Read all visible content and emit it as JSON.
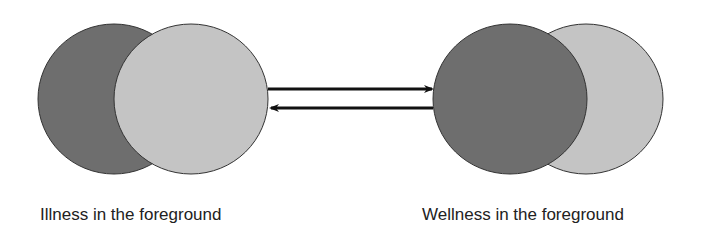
{
  "diagram": {
    "left_state": {
      "label": "Illness in the foreground",
      "front_circle": "illness",
      "back_circle": "wellness"
    },
    "right_state": {
      "label": "Wellness in the foreground",
      "front_circle": "wellness",
      "back_circle": "illness"
    },
    "arrows": [
      {
        "direction": "right",
        "from": "left_state",
        "to": "right_state"
      },
      {
        "direction": "left",
        "from": "right_state",
        "to": "left_state"
      }
    ],
    "colors": {
      "dark_circle": "#6e6e6e",
      "light_circle": "#c4c4c4",
      "outline": "#333333",
      "arrow": "#111111"
    }
  }
}
